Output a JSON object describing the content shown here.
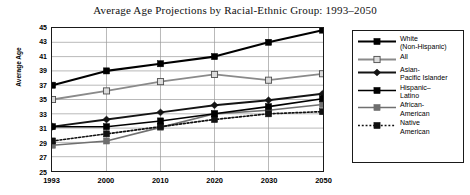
{
  "chart_data": {
    "type": "line",
    "title": "Average Age Projections by Racial-Ethnic Group: 1993–2050",
    "xlabel": "",
    "ylabel": "Average Age",
    "categories": [
      "1993",
      "2000",
      "2010",
      "2020",
      "2030",
      "2050"
    ],
    "ylim": [
      25,
      45
    ],
    "ytick_labels": [
      "45",
      "43",
      "41",
      "39",
      "37",
      "35",
      "33",
      "31",
      "29",
      "27",
      "25"
    ],
    "ytick_step": 2,
    "grid": "horizontal-and-vertical",
    "legend_position": "right",
    "series": [
      {
        "name": "White\n(Non-Hispanic)",
        "values": [
          37.0,
          39.0,
          40.0,
          41.0,
          43.0,
          44.7
        ],
        "color": "#000000",
        "marker": "square-filled",
        "marker_fill": "#000000",
        "dash": "solid",
        "width": 2.1
      },
      {
        "name": "All",
        "values": [
          35.0,
          36.2,
          37.5,
          38.5,
          37.7,
          38.6
        ],
        "color": "#8a8a8a",
        "marker": "square-open",
        "marker_fill": "#dcdcdc",
        "dash": "solid",
        "width": 1.8
      },
      {
        "name": "Asian-\nPacific Islander",
        "values": [
          31.2,
          32.2,
          33.2,
          34.2,
          34.9,
          35.8
        ],
        "color": "#141414",
        "marker": "diamond-filled",
        "marker_fill": "#141414",
        "dash": "solid",
        "width": 1.9
      },
      {
        "name": "Hispanic–\nLatino",
        "values": [
          31.2,
          31.2,
          32.0,
          33.0,
          34.0,
          35.1
        ],
        "color": "#000000",
        "marker": "square-filled",
        "marker_fill": "#000000",
        "dash": "solid",
        "width": 1.6
      },
      {
        "name": "African-\nAmerican",
        "values": [
          28.6,
          29.2,
          31.1,
          33.0,
          33.5,
          34.3
        ],
        "color": "#707070",
        "marker": "square-filled",
        "marker_fill": "#6e6e6e",
        "dash": "solid",
        "width": 1.7
      },
      {
        "name": "Native\nAmerican",
        "values": [
          29.2,
          30.2,
          31.2,
          32.2,
          33.0,
          33.3
        ],
        "color": "#111111",
        "marker": "square-filled",
        "marker_fill": "#111111",
        "dash": "dotted",
        "width": 1.7
      }
    ]
  }
}
